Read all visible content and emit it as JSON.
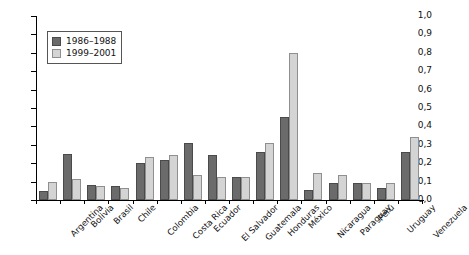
{
  "chart_data": {
    "type": "bar",
    "title": "",
    "xlabel": "",
    "ylabel": "",
    "ylim": [
      0.0,
      1.0
    ],
    "ytick_step": 0.1,
    "grid": false,
    "legend_position": "top-left",
    "ytick_labels": [
      "0,0",
      "0,1",
      "0,2",
      "0,3",
      "0,4",
      "0,5",
      "0,6",
      "0,7",
      "0,8",
      "0,9",
      "1,0"
    ],
    "categories": [
      "Argentina",
      "Bolivia",
      "Brasil",
      "Chile",
      "Colombia",
      "Costa Rica",
      "Ecuador",
      "El Salvador",
      "Guatemala",
      "Honduras",
      "México",
      "Nicaragua",
      "Paraguay",
      "Perú",
      "Uruguay",
      "Venezuela"
    ],
    "series": [
      {
        "name": "1986–1988",
        "color": "#6b6b6b",
        "values": [
          0.05,
          0.25,
          0.08,
          0.075,
          0.2,
          0.22,
          0.31,
          0.245,
          0.125,
          0.26,
          0.45,
          0.055,
          0.095,
          0.09,
          0.065,
          0.26
        ]
      },
      {
        "name": "1999–2001",
        "color": "#d4d4d4",
        "values": [
          0.1,
          0.115,
          0.075,
          0.065,
          0.235,
          0.245,
          0.135,
          0.125,
          0.125,
          0.31,
          0.8,
          0.145,
          0.135,
          0.09,
          0.09,
          0.34
        ]
      }
    ]
  },
  "legend": {
    "items": [
      {
        "label": "1986–1988",
        "swatch": "series-0-swatch"
      },
      {
        "label": "1999–2001",
        "swatch": "series-1-swatch"
      }
    ]
  }
}
